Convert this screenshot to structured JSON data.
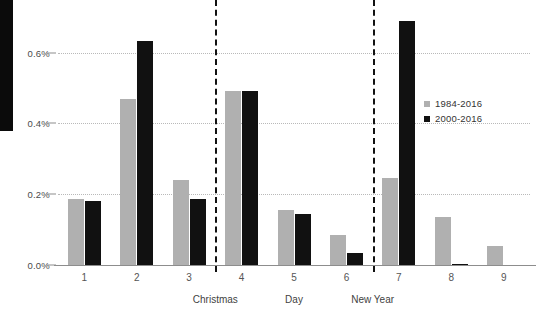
{
  "chart_data": {
    "type": "bar",
    "title": "",
    "subtitle": "",
    "xlabel": "Day",
    "ylabel": "",
    "categories": [
      "1",
      "2",
      "3",
      "4",
      "5",
      "6",
      "7",
      "8",
      "9"
    ],
    "series": [
      {
        "name": "1984-2016",
        "color": "#b0b0b0",
        "values": [
          0.185,
          0.47,
          0.24,
          0.49,
          0.155,
          0.085,
          0.245,
          0.135,
          0.055
        ]
      },
      {
        "name": "2000-2016",
        "color": "#111111",
        "values": [
          0.182,
          0.632,
          0.185,
          0.49,
          0.145,
          0.035,
          0.69,
          0.004,
          0.0
        ]
      }
    ],
    "ylim": [
      0.0,
      0.72
    ],
    "yticks": [
      0.0,
      0.2,
      0.4,
      0.6
    ],
    "ytick_labels": [
      "0.0%",
      "0.2%",
      "0.4%",
      "0.6%"
    ],
    "grid": true,
    "grid_axis": "y",
    "legend_position": "right",
    "value_unit": "%",
    "annotations": [
      {
        "label": "Christmas",
        "after_category": "3",
        "style": "dashed-vertical"
      },
      {
        "label": "New Year",
        "after_category": "6",
        "style": "dashed-vertical"
      }
    ]
  },
  "legend": {
    "items": [
      {
        "label": "1984-2016",
        "color": "#b0b0b0"
      },
      {
        "label": "2000-2016",
        "color": "#111111"
      }
    ]
  },
  "axes": {
    "x_title": "Day",
    "y_tick_labels": [
      "0.0%",
      "0.2%",
      "0.4%",
      "0.6%"
    ]
  },
  "markers": {
    "christmas": "Christmas",
    "new_year": "New Year"
  }
}
